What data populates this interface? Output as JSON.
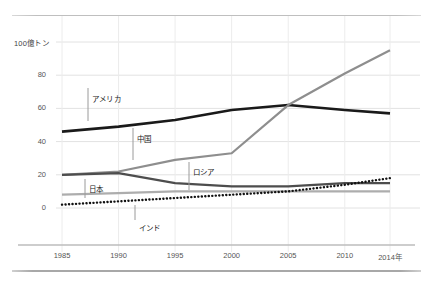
{
  "chart_data": {
    "type": "line",
    "title": "",
    "subtitle": "",
    "xlabel": "",
    "ylabel": "100億トン",
    "unit_label": "100億トン",
    "x": [
      1985,
      1990,
      1995,
      2000,
      2005,
      2010,
      2014
    ],
    "tick_labels_x": [
      "1985",
      "1990",
      "1995",
      "2000",
      "2005",
      "2010",
      "2014年"
    ],
    "tick_labels_y": [
      "0",
      "20",
      "40",
      "60",
      "80",
      "100億トン"
    ],
    "ticks_y": [
      0,
      20,
      40,
      60,
      80,
      100
    ],
    "xlim": [
      1985,
      2014
    ],
    "ylim": [
      0,
      100
    ],
    "grid": true,
    "legend_position": "inline-annotations",
    "series": [
      {
        "name": "アメリカ",
        "color": "#1a1a1a",
        "style": "solid",
        "width": 2.6,
        "values": [
          46,
          49,
          53,
          59,
          62,
          59,
          57
        ]
      },
      {
        "name": "中国",
        "color": "#8e8e8e",
        "style": "solid",
        "width": 2.2,
        "values": [
          20,
          22,
          29,
          33,
          62,
          81,
          95
        ]
      },
      {
        "name": "ロシア",
        "color": "#4d4d4d",
        "style": "solid",
        "width": 2.2,
        "values": [
          20,
          21,
          15,
          13,
          13,
          15,
          15
        ]
      },
      {
        "name": "日本",
        "color": "#adadad",
        "style": "solid",
        "width": 2.2,
        "values": [
          8,
          9,
          10,
          10,
          10,
          10,
          10
        ]
      },
      {
        "name": "インド",
        "color": "#111111",
        "style": "dotted",
        "width": 2.4,
        "values": [
          2,
          4,
          6,
          8,
          10,
          14,
          18
        ]
      }
    ],
    "annotations": [
      {
        "label": "アメリカ",
        "text_x": 92,
        "text_y": 93,
        "leader_x": 88,
        "leader_y_top": 88,
        "leader_y_bottom": 121
      },
      {
        "label": "中国",
        "text_x": 137,
        "text_y": 133,
        "leader_x": 133,
        "leader_y_top": 128,
        "leader_y_bottom": 160
      },
      {
        "label": "ロシア",
        "text_x": 193,
        "text_y": 166,
        "leader_x": 189,
        "leader_y_top": 162,
        "leader_y_bottom": 190
      },
      {
        "label": "日本",
        "text_x": 89,
        "text_y": 183,
        "leader_x": 85,
        "leader_y_top": 179,
        "leader_y_bottom": 198
      },
      {
        "label": "インド",
        "text_x": 139,
        "text_y": 222,
        "leader_x": 135,
        "leader_y_top": 205,
        "leader_y_bottom": 220
      }
    ],
    "colors": {
      "america": "#1a1a1a",
      "china": "#8e8e8e",
      "russia": "#4d4d4d",
      "japan": "#adadad",
      "india": "#111111",
      "grid": "#e2e2e2",
      "axis": "#bdbdbd",
      "rule": "#b5b5b5"
    }
  }
}
